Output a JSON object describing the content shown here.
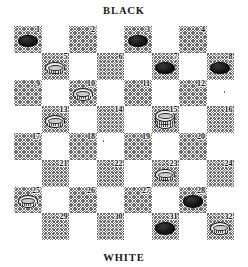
{
  "diagram": {
    "type": "checkers-draughts-board",
    "top_label": "BLACK",
    "bottom_label": "WHITE",
    "rows": 8,
    "columns": 8,
    "numbered_squares": 32,
    "colors": {
      "light_square": "#ffffff",
      "dark_square_hatch": "#6e6e6e",
      "black_piece": "#111111",
      "white_piece": "#efefef",
      "number_text": "#111111"
    }
  },
  "squares": [
    {
      "n": "1",
      "piece": "black-man"
    },
    {
      "n": "2",
      "piece": "empty"
    },
    {
      "n": "3",
      "piece": "black-man"
    },
    {
      "n": "4",
      "piece": "empty"
    },
    {
      "n": "5",
      "piece": "white-man"
    },
    {
      "n": "6",
      "piece": "empty"
    },
    {
      "n": "7",
      "piece": "black-man"
    },
    {
      "n": "8",
      "piece": "black-man"
    },
    {
      "n": "9",
      "piece": "empty"
    },
    {
      "n": "10",
      "piece": "white-man"
    },
    {
      "n": "11",
      "piece": "empty"
    },
    {
      "n": "12",
      "piece": "empty"
    },
    {
      "n": "13",
      "piece": "white-man"
    },
    {
      "n": "14",
      "piece": "empty"
    },
    {
      "n": "15",
      "piece": "white-king"
    },
    {
      "n": "16",
      "piece": "empty"
    },
    {
      "n": "17",
      "piece": "empty"
    },
    {
      "n": "18",
      "piece": "empty"
    },
    {
      "n": "19",
      "piece": "empty"
    },
    {
      "n": "20",
      "piece": "empty"
    },
    {
      "n": "21",
      "piece": "empty"
    },
    {
      "n": "22",
      "piece": "empty"
    },
    {
      "n": "23",
      "piece": "white-man"
    },
    {
      "n": "24",
      "piece": "empty"
    },
    {
      "n": "25",
      "piece": "white-man"
    },
    {
      "n": "26",
      "piece": "empty"
    },
    {
      "n": "27",
      "piece": "empty"
    },
    {
      "n": "28",
      "piece": "black-man"
    },
    {
      "n": "29",
      "piece": "empty"
    },
    {
      "n": "30",
      "piece": "empty"
    },
    {
      "n": "31",
      "piece": "black-man"
    },
    {
      "n": "32",
      "piece": "white-man"
    }
  ],
  "position_summary": {
    "black_men": [
      "1",
      "3",
      "7",
      "8",
      "28",
      "31"
    ],
    "white_men": [
      "5",
      "10",
      "13",
      "23",
      "25",
      "32"
    ],
    "white_kings": [
      "15"
    ],
    "black_kings": []
  }
}
